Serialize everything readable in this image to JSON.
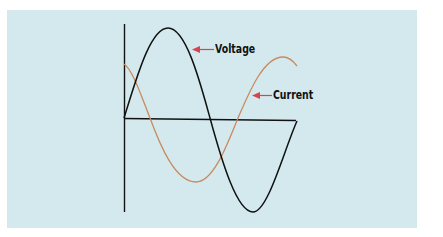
{
  "diagram": {
    "labels": {
      "voltage": "Voltage",
      "current": "Current"
    },
    "colors": {
      "background": "#d3e9ee",
      "voltage_curve": "#111111",
      "current_curve": "#c98a5e",
      "axes": "#111111",
      "arrow": "#d9434b"
    }
  }
}
